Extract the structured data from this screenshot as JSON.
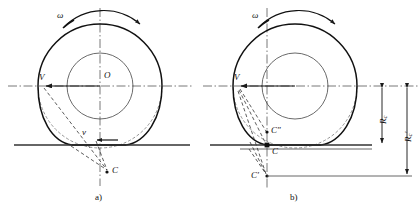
{
  "figure": {
    "type": "engineering-diagram",
    "background": "#ffffff",
    "ink_color": "#1a1a1a",
    "thin_color": "#555555"
  },
  "panels": [
    {
      "id": "a",
      "caption": "a)",
      "center": {
        "label": "O",
        "x": 100,
        "y": 86
      },
      "tyre_outer_radius": 62,
      "rim_radius": 33,
      "ground_y": 145,
      "labels": {
        "omega": "ω",
        "velocity_center": "V",
        "velocity_contact": "v",
        "instant_center": "C"
      },
      "points": {
        "V": {
          "x": 41,
          "y": 86
        },
        "v": {
          "x": 100,
          "y": 140
        },
        "C": {
          "x": 108,
          "y": 172
        }
      }
    },
    {
      "id": "b",
      "caption": "b)",
      "center": {
        "label": "O",
        "x": 295,
        "y": 86
      },
      "tyre_outer_radius": 62,
      "rim_radius": 33,
      "ground_y": 145,
      "labels": {
        "omega": "ω",
        "velocity_center": "V",
        "instant_center_low": "C′",
        "instant_center_mid": "C",
        "instant_center_high": "C″"
      },
      "points": {
        "V": {
          "x": 236,
          "y": 86
        },
        "C_high": {
          "x": 267,
          "y": 132
        },
        "C_mid": {
          "x": 267,
          "y": 145
        },
        "C_low": {
          "x": 267,
          "y": 176
        }
      },
      "dimensions": [
        {
          "name": "R_c",
          "symbol": "R",
          "subscript": "c",
          "prime": "",
          "from_y": 86,
          "to_y": 145,
          "x": 382
        },
        {
          "name": "R_c_prime",
          "symbol": "R",
          "subscript": "c",
          "prime": "′",
          "from_y": 86,
          "to_y": 176,
          "x": 407
        }
      ]
    }
  ]
}
